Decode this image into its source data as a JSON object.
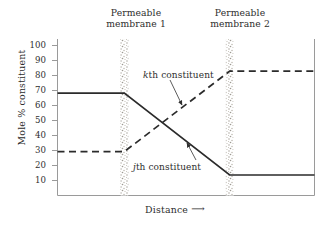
{
  "chart_data": {
    "type": "line",
    "title": "",
    "xlabel": "Distance",
    "ylabel": "Mole % constituent",
    "xlim": [
      0,
      100
    ],
    "ylim": [
      0,
      107
    ],
    "grid": false,
    "legend_position": "inline-annotations",
    "y_ticks": [
      10,
      20,
      30,
      40,
      50,
      60,
      70,
      80,
      90,
      100
    ],
    "y_tick_labels": [
      "10",
      "20",
      "30",
      "40",
      "50",
      "60",
      "70",
      "80",
      "90",
      "100"
    ],
    "x_ticks": [],
    "x_tick_labels": [],
    "annotations": [
      {
        "name": "permeable-membrane-1",
        "text_line1": "Permeable",
        "text_line2": "membrane 1",
        "x": 26,
        "style": "stippled-vertical-band"
      },
      {
        "name": "permeable-membrane-2",
        "text_line1": "Permeable",
        "text_line2": "membrane 2",
        "x": 67,
        "style": "stippled-vertical-band"
      },
      {
        "name": "kth-constituent-callout",
        "text_italic": "k",
        "text": "th  constituent",
        "points_to_series": "kth constituent"
      },
      {
        "name": "jth-constituent-callout",
        "text_italic": "j",
        "text": "th  constituent",
        "points_to_series": "jth constituent"
      }
    ],
    "series": [
      {
        "name": "jth constituent",
        "label_italic": "j",
        "label_rest": "th  constituent",
        "style": "solid",
        "color": "#2b2b2b",
        "x": [
          0,
          26,
          67,
          100
        ],
        "values": [
          70,
          70,
          14,
          14
        ]
      },
      {
        "name": "kth constituent",
        "label_italic": "k",
        "label_rest": "th  constituent",
        "style": "dashed",
        "color": "#2b2b2b",
        "x": [
          0,
          26,
          67,
          100
        ],
        "values": [
          30,
          30,
          85,
          85
        ]
      }
    ]
  },
  "axes": {
    "y_title": "Mole % constituent",
    "y_title_prefix": "Mole ",
    "y_title_percent": "%",
    "y_title_suffix": " constituent",
    "x_title": "Distance",
    "x_arrow": "⟶"
  },
  "labels": {
    "membrane1_line1": "Permeable",
    "membrane1_line2": "membrane 1",
    "membrane2_line1": "Permeable",
    "membrane2_line2": "membrane 2",
    "k_italic": "k",
    "k_rest": "th  constituent",
    "j_italic": "j",
    "j_rest": "th  constituent",
    "tick_100": "100",
    "tick_90": "90",
    "tick_80": "80",
    "tick_70": "70",
    "tick_60": "60",
    "tick_50": "50",
    "tick_40": "40",
    "tick_30": "30",
    "tick_20": "20",
    "tick_10": "10"
  },
  "colors": {
    "line": "#2b2b2b",
    "axis": "#9a9a9a",
    "membrane_band": "#b9b5ad",
    "text": "#2e2e2e",
    "background": "#ffffff"
  }
}
